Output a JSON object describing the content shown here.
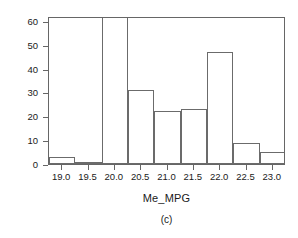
{
  "chart_data": {
    "type": "bar",
    "title": "",
    "subtitle": "",
    "caption": "(c)",
    "xlabel": "Me_MPG",
    "ylabel": "Frequency",
    "grid": false,
    "legend": "none",
    "bin_width": 0.5,
    "xlim": [
      18.75,
      23.25
    ],
    "ylim": [
      0,
      62
    ],
    "bin_edges": [
      18.75,
      19.25,
      19.75,
      20.25,
      20.75,
      21.25,
      21.75,
      22.25,
      22.75,
      23.25
    ],
    "categories": [
      "18.75-19.25",
      "19.25-19.75",
      "19.75-20.25",
      "20.25-20.75",
      "20.75-21.25",
      "21.25-21.75",
      "21.75-22.25",
      "22.25-22.75",
      "22.75-23.25"
    ],
    "bin_centers": [
      19.0,
      19.5,
      20.0,
      20.5,
      21.0,
      21.5,
      22.0,
      22.5,
      23.0
    ],
    "values": [
      3,
      1,
      62,
      31,
      22,
      23,
      47,
      9,
      5
    ],
    "xticks": [
      19.0,
      19.5,
      20.0,
      20.5,
      21.0,
      21.5,
      22.0,
      22.5,
      23.0
    ],
    "xtick_labels": [
      "19.0",
      "19.5",
      "20.0",
      "20.5",
      "21.0",
      "21.5",
      "22.0",
      "22.5",
      "23.0"
    ],
    "yticks": [
      0,
      10,
      20,
      30,
      40,
      50,
      60
    ],
    "ytick_labels": [
      "0",
      "10",
      "20",
      "30",
      "40",
      "50",
      "60"
    ],
    "colors": {
      "bar_fill": "#ffffff",
      "bar_border": "#6b6b6b",
      "axis": "#666666",
      "text": "#1a1a1a",
      "background": "#ffffff"
    }
  }
}
